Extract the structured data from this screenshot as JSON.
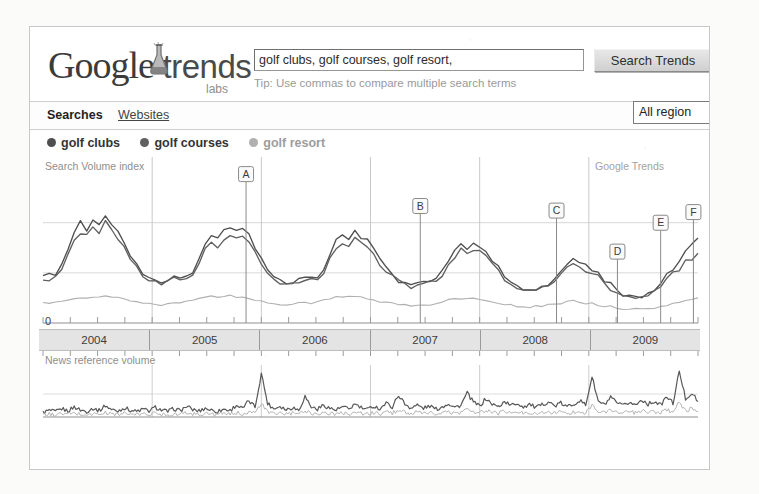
{
  "brand": {
    "logo_google": "Google",
    "logo_trends": "trends",
    "labs": "labs",
    "flask_icon": "lab-flask-icon"
  },
  "search": {
    "value": "golf clubs, golf courses, golf resort,",
    "placeholder": "Enter search terms",
    "button_label": "Search Trends",
    "tip": "Tip: Use commas to compare multiple search terms"
  },
  "nav": {
    "tabs": [
      {
        "label": "Searches",
        "active": true
      },
      {
        "label": "Websites",
        "active": false
      }
    ],
    "region": {
      "selected": "All region",
      "options": [
        "All regions",
        "United States",
        "United Kingdom",
        "Canada",
        "Australia"
      ]
    }
  },
  "legend": {
    "items": [
      {
        "label": "golf clubs",
        "color": "#4f4f4f"
      },
      {
        "label": "golf courses",
        "color": "#606060"
      },
      {
        "label": "golf resort",
        "color": "#b0b0b0"
      }
    ]
  },
  "main_chart": {
    "label": "Search Volume index",
    "watermark": "Google Trends",
    "zero_label": "0"
  },
  "news_chart": {
    "label": "News reference volume"
  },
  "annotations": [
    {
      "id": "A",
      "x_pct": 31.0,
      "top_pct": 5.0
    },
    {
      "id": "B",
      "x_pct": 57.6,
      "top_pct": 26.0
    },
    {
      "id": "C",
      "x_pct": 78.4,
      "top_pct": 29.0
    },
    {
      "id": "D",
      "x_pct": 87.7,
      "top_pct": 56.0
    },
    {
      "id": "E",
      "x_pct": 94.3,
      "top_pct": 37.0
    },
    {
      "id": "F",
      "x_pct": 99.3,
      "top_pct": 30.0
    }
  ],
  "chart_data": {
    "type": "line",
    "title": "Search Volume index",
    "subtitle": "News reference volume",
    "xlabel": "",
    "ylabel": "Search Volume index",
    "ylim": [
      0,
      1.0
    ],
    "grid": true,
    "legend_position": "top-left",
    "watermark": "Google Trends",
    "x_tick_labels": [
      "2004",
      "2005",
      "2006",
      "2007",
      "2008",
      "2009"
    ],
    "x_minor_ticks_per_year": 4,
    "annotation_labels": [
      "A",
      "B",
      "C",
      "D",
      "E",
      "F"
    ],
    "series": [
      {
        "name": "golf clubs",
        "color": "#4f4f4f",
        "values": [
          0.3,
          0.31,
          0.33,
          0.38,
          0.47,
          0.58,
          0.66,
          0.62,
          0.68,
          0.64,
          0.72,
          0.66,
          0.6,
          0.52,
          0.44,
          0.38,
          0.33,
          0.3,
          0.28,
          0.27,
          0.29,
          0.31,
          0.28,
          0.3,
          0.33,
          0.41,
          0.52,
          0.58,
          0.56,
          0.61,
          0.64,
          0.6,
          0.62,
          0.57,
          0.5,
          0.43,
          0.36,
          0.31,
          0.28,
          0.27,
          0.26,
          0.28,
          0.3,
          0.29,
          0.31,
          0.36,
          0.45,
          0.54,
          0.58,
          0.55,
          0.6,
          0.57,
          0.54,
          0.48,
          0.42,
          0.36,
          0.31,
          0.28,
          0.26,
          0.25,
          0.26,
          0.28,
          0.27,
          0.29,
          0.33,
          0.4,
          0.48,
          0.52,
          0.5,
          0.54,
          0.51,
          0.47,
          0.42,
          0.36,
          0.31,
          0.27,
          0.24,
          0.22,
          0.21,
          0.22,
          0.24,
          0.26,
          0.28,
          0.33,
          0.4,
          0.44,
          0.41,
          0.38,
          0.35,
          0.32,
          0.28,
          0.25,
          0.22,
          0.19,
          0.17,
          0.16,
          0.17,
          0.19,
          0.22,
          0.26,
          0.31,
          0.36,
          0.42,
          0.48,
          0.52,
          0.55
        ]
      },
      {
        "name": "golf courses",
        "color": "#606060",
        "values": [
          0.28,
          0.29,
          0.31,
          0.36,
          0.44,
          0.54,
          0.6,
          0.57,
          0.62,
          0.59,
          0.66,
          0.61,
          0.56,
          0.49,
          0.42,
          0.36,
          0.32,
          0.29,
          0.27,
          0.26,
          0.28,
          0.3,
          0.27,
          0.29,
          0.32,
          0.39,
          0.48,
          0.53,
          0.51,
          0.56,
          0.58,
          0.55,
          0.57,
          0.52,
          0.46,
          0.4,
          0.34,
          0.3,
          0.27,
          0.26,
          0.25,
          0.27,
          0.29,
          0.28,
          0.3,
          0.34,
          0.42,
          0.49,
          0.53,
          0.5,
          0.55,
          0.52,
          0.49,
          0.44,
          0.39,
          0.34,
          0.3,
          0.27,
          0.25,
          0.24,
          0.25,
          0.27,
          0.26,
          0.28,
          0.31,
          0.37,
          0.44,
          0.48,
          0.46,
          0.49,
          0.47,
          0.43,
          0.39,
          0.34,
          0.29,
          0.26,
          0.23,
          0.21,
          0.2,
          0.21,
          0.23,
          0.25,
          0.27,
          0.31,
          0.37,
          0.4,
          0.38,
          0.35,
          0.32,
          0.3,
          0.26,
          0.23,
          0.21,
          0.18,
          0.16,
          0.15,
          0.16,
          0.18,
          0.21,
          0.24,
          0.28,
          0.32,
          0.36,
          0.4,
          0.43,
          0.45
        ]
      },
      {
        "name": "golf resort",
        "color": "#b0b0b0",
        "values": [
          0.13,
          0.13,
          0.14,
          0.14,
          0.15,
          0.16,
          0.17,
          0.16,
          0.17,
          0.17,
          0.18,
          0.17,
          0.17,
          0.16,
          0.15,
          0.14,
          0.13,
          0.13,
          0.12,
          0.12,
          0.13,
          0.13,
          0.13,
          0.14,
          0.15,
          0.16,
          0.17,
          0.18,
          0.17,
          0.18,
          0.18,
          0.17,
          0.17,
          0.16,
          0.15,
          0.14,
          0.13,
          0.13,
          0.12,
          0.12,
          0.12,
          0.13,
          0.13,
          0.13,
          0.14,
          0.15,
          0.16,
          0.17,
          0.17,
          0.17,
          0.18,
          0.17,
          0.16,
          0.15,
          0.14,
          0.14,
          0.13,
          0.12,
          0.12,
          0.11,
          0.12,
          0.12,
          0.12,
          0.13,
          0.14,
          0.15,
          0.16,
          0.16,
          0.16,
          0.17,
          0.16,
          0.15,
          0.14,
          0.13,
          0.12,
          0.12,
          0.11,
          0.11,
          0.1,
          0.11,
          0.11,
          0.12,
          0.12,
          0.13,
          0.14,
          0.15,
          0.14,
          0.13,
          0.13,
          0.12,
          0.11,
          0.11,
          0.1,
          0.09,
          0.09,
          0.09,
          0.09,
          0.1,
          0.1,
          0.11,
          0.12,
          0.13,
          0.14,
          0.15,
          0.16,
          0.16
        ]
      }
    ],
    "news_series": [
      {
        "name": "news-primary",
        "color": "#585858",
        "values": [
          0.1,
          0.14,
          0.11,
          0.18,
          0.13,
          0.22,
          0.15,
          0.12,
          0.19,
          0.14,
          0.25,
          0.16,
          0.13,
          0.2,
          0.15,
          0.12,
          0.17,
          0.13,
          0.21,
          0.15,
          0.12,
          0.18,
          0.14,
          0.23,
          0.16,
          0.13,
          0.19,
          0.15,
          0.12,
          0.17,
          0.14,
          0.26,
          0.18,
          0.35,
          0.22,
          0.95,
          0.3,
          0.18,
          0.24,
          0.16,
          0.21,
          0.15,
          0.45,
          0.22,
          0.17,
          0.26,
          0.19,
          0.15,
          0.22,
          0.17,
          0.28,
          0.2,
          0.16,
          0.24,
          0.18,
          0.3,
          0.22,
          0.48,
          0.28,
          0.2,
          0.26,
          0.19,
          0.24,
          0.17,
          0.22,
          0.3,
          0.21,
          0.26,
          0.52,
          0.32,
          0.24,
          0.4,
          0.28,
          0.22,
          0.34,
          0.25,
          0.3,
          0.22,
          0.28,
          0.2,
          0.26,
          0.34,
          0.24,
          0.3,
          0.22,
          0.28,
          0.36,
          0.26,
          0.88,
          0.34,
          0.26,
          0.42,
          0.3,
          0.24,
          0.32,
          0.26,
          0.38,
          0.28,
          0.34,
          0.26,
          0.44,
          0.3,
          1.0,
          0.4,
          0.52,
          0.34
        ]
      },
      {
        "name": "news-secondary",
        "color": "#b4b4b4",
        "values": [
          0.05,
          0.06,
          0.05,
          0.07,
          0.06,
          0.08,
          0.06,
          0.05,
          0.07,
          0.06,
          0.09,
          0.07,
          0.06,
          0.08,
          0.06,
          0.05,
          0.07,
          0.06,
          0.08,
          0.06,
          0.05,
          0.07,
          0.06,
          0.09,
          0.07,
          0.06,
          0.08,
          0.06,
          0.05,
          0.07,
          0.06,
          0.09,
          0.07,
          0.12,
          0.08,
          0.3,
          0.1,
          0.07,
          0.09,
          0.06,
          0.08,
          0.06,
          0.14,
          0.08,
          0.07,
          0.1,
          0.07,
          0.06,
          0.09,
          0.07,
          0.11,
          0.08,
          0.06,
          0.09,
          0.07,
          0.11,
          0.08,
          0.16,
          0.1,
          0.08,
          0.1,
          0.07,
          0.09,
          0.07,
          0.08,
          0.11,
          0.08,
          0.1,
          0.18,
          0.11,
          0.09,
          0.14,
          0.1,
          0.08,
          0.12,
          0.09,
          0.11,
          0.08,
          0.1,
          0.08,
          0.09,
          0.12,
          0.09,
          0.11,
          0.08,
          0.1,
          0.13,
          0.09,
          0.26,
          0.12,
          0.09,
          0.15,
          0.11,
          0.09,
          0.11,
          0.09,
          0.13,
          0.1,
          0.12,
          0.09,
          0.15,
          0.11,
          0.32,
          0.14,
          0.18,
          0.12
        ]
      }
    ]
  }
}
